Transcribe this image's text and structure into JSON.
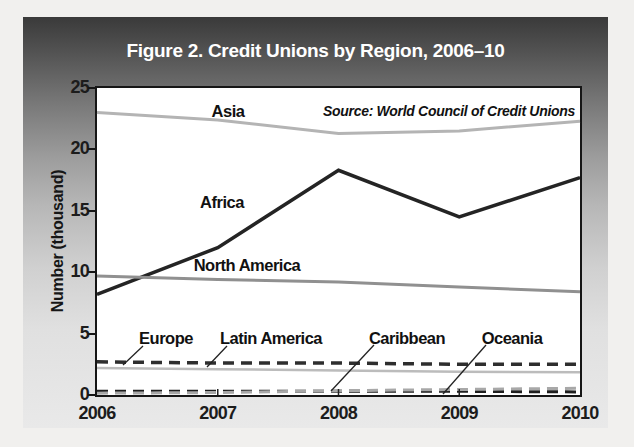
{
  "figure": {
    "title": "Figure 2. Credit Unions by Region, 2006–10",
    "source": "Source: World Council of Credit Unions",
    "y_axis_label": "Number (thousand)"
  },
  "colors": {
    "card_gradient_top": "#3a3a3a",
    "card_gradient_bottom": "#e9e9e9",
    "plot_background": "#ffffff",
    "axis_and_text": "#161616",
    "title_text": "#ffffff",
    "dark_line": "#242424",
    "medium_gray_line": "#909090",
    "light_gray_line": "#b4b4b4"
  },
  "chart_data": {
    "type": "line",
    "title": "Figure 2. Credit Unions by Region, 2006–10",
    "source": "Source: World Council of Credit Unions",
    "xlabel": "",
    "ylabel": "Number (thousand)",
    "x": [
      2006,
      2007,
      2008,
      2009,
      2010
    ],
    "x_tick_labels": [
      "2006",
      "2007",
      "2008",
      "2009",
      "2010"
    ],
    "y_ticks": [
      0,
      5,
      10,
      15,
      20,
      25
    ],
    "ylim": [
      0,
      25
    ],
    "grid": false,
    "legend_position": "inline-labels",
    "series": [
      {
        "name": "Asia",
        "values": [
          23.0,
          22.4,
          21.3,
          21.5,
          22.3
        ],
        "color": "#b4b4b4",
        "style": "solid",
        "width": 3
      },
      {
        "name": "Africa",
        "values": [
          8.2,
          12.0,
          18.3,
          14.5,
          17.7
        ],
        "color": "#242424",
        "style": "solid",
        "width": 3.5
      },
      {
        "name": "North America",
        "values": [
          9.7,
          9.4,
          9.2,
          8.8,
          8.4
        ],
        "color": "#909090",
        "style": "solid",
        "width": 3
      },
      {
        "name": "Europe",
        "values": [
          2.7,
          2.6,
          2.6,
          2.5,
          2.5
        ],
        "color": "#2e2e2e",
        "style": "dashed",
        "width": 3.5
      },
      {
        "name": "Latin America",
        "values": [
          2.2,
          2.1,
          2.0,
          1.9,
          1.85
        ],
        "color": "#bcbcbc",
        "style": "solid",
        "width": 2.5
      },
      {
        "name": "Caribbean",
        "values": [
          0.3,
          0.3,
          0.3,
          0.3,
          0.25
        ],
        "color": "#1e1e1e",
        "style": "dashed",
        "width": 3
      },
      {
        "name": "Oceania",
        "values": [
          0.15,
          0.2,
          0.35,
          0.45,
          0.55
        ],
        "color": "#a8a8a8",
        "style": "dashed",
        "width": 3
      }
    ],
    "callouts": [
      {
        "text": "Asia",
        "x": 131,
        "y": 23,
        "leader": null
      },
      {
        "text": "Africa",
        "x": 125,
        "y": 114,
        "leader": null
      },
      {
        "text": "North America",
        "x": 150,
        "y": 177,
        "leader": null
      },
      {
        "text": "Europe",
        "x": 69,
        "y": 250,
        "leader": [
          26,
          277,
          46,
          258
        ]
      },
      {
        "text": "Latin America",
        "x": 174,
        "y": 250,
        "leader": [
          110,
          279,
          130,
          258
        ]
      },
      {
        "text": "Caribbean",
        "x": 310,
        "y": 250,
        "leader": [
          234,
          303,
          277,
          257
        ]
      },
      {
        "text": "Oceania",
        "x": 415,
        "y": 250,
        "leader": [
          346,
          306,
          389,
          257
        ]
      }
    ]
  }
}
